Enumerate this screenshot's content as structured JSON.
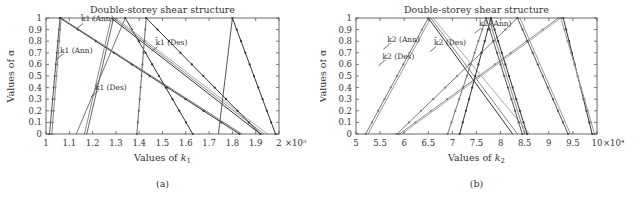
{
  "chart_data": [
    {
      "id": "a",
      "type": "line",
      "title": "Double-storey shear structure",
      "xlabel": "Values of k1",
      "xlabel_base": "Values of ",
      "xlabel_var": "k",
      "xlabel_sub": "1",
      "ylabel": "Values of α",
      "caption": "(a)",
      "x_multiplier": "×10⁵",
      "xlim": [
        1,
        2
      ],
      "ylim": [
        0,
        1
      ],
      "xticks": [
        "1",
        "1.1",
        "1.2",
        "1.3",
        "1.4",
        "1.5",
        "1.6",
        "1.7",
        "1.8",
        "1.9",
        "2"
      ],
      "yticks": [
        "0",
        "0.1",
        "0.2",
        "0.3",
        "0.4",
        "0.5",
        "0.6",
        "0.7",
        "0.8",
        "0.9",
        "1"
      ],
      "grid": false,
      "annotations": [
        {
          "text": "k̲1 (Ann)",
          "x": 1.06,
          "y": 0.7
        },
        {
          "text": "k̄1 (Ann)",
          "x": 1.15,
          "y": 0.97
        },
        {
          "text": "k̲1 (Des)",
          "x": 1.21,
          "y": 0.38
        },
        {
          "text": "k̄1 (Des)",
          "x": 1.47,
          "y": 0.77
        }
      ],
      "segments": [
        {
          "x": [
            1.015,
            1.06
          ],
          "y": [
            0,
            1
          ],
          "shade": "#555",
          "marker": true
        },
        {
          "x": [
            1.025,
            1.065
          ],
          "y": [
            0,
            1
          ],
          "shade": "#888",
          "marker": true
        },
        {
          "x": [
            1.06,
            1.83
          ],
          "y": [
            1,
            0
          ],
          "shade": "#333",
          "marker": true
        },
        {
          "x": [
            1.065,
            1.84
          ],
          "y": [
            1,
            0
          ],
          "shade": "#777",
          "marker": false
        },
        {
          "x": [
            1.13,
            1.34
          ],
          "y": [
            0,
            1
          ],
          "shade": "#777",
          "marker": false
        },
        {
          "x": [
            1.165,
            1.28
          ],
          "y": [
            0,
            1
          ],
          "shade": "#888",
          "marker": false
        },
        {
          "x": [
            1.175,
            1.29
          ],
          "y": [
            0,
            1
          ],
          "shade": "#666",
          "marker": false
        },
        {
          "x": [
            1.34,
            1.63
          ],
          "y": [
            1,
            0
          ],
          "shade": "#333",
          "marker": true
        },
        {
          "x": [
            1.28,
            1.92
          ],
          "y": [
            1,
            0
          ],
          "shade": "#333",
          "marker": false
        },
        {
          "x": [
            1.29,
            1.935
          ],
          "y": [
            1,
            0
          ],
          "shade": "#888",
          "marker": false
        },
        {
          "x": [
            1.3,
            1.95
          ],
          "y": [
            1,
            0
          ],
          "shade": "#aaa",
          "marker": false
        },
        {
          "x": [
            1.39,
            1.43
          ],
          "y": [
            0,
            1
          ],
          "shade": "#666",
          "marker": true
        },
        {
          "x": [
            1.43,
            1.92
          ],
          "y": [
            1,
            0
          ],
          "shade": "#333",
          "marker": true
        },
        {
          "x": [
            1.74,
            1.8
          ],
          "y": [
            0,
            1
          ],
          "shade": "#555",
          "marker": false
        },
        {
          "x": [
            1.8,
            1.985
          ],
          "y": [
            1,
            0
          ],
          "shade": "#333",
          "marker": true
        }
      ]
    },
    {
      "id": "b",
      "type": "line",
      "title": "Double-storey shear structure",
      "xlabel": "Values of k2",
      "xlabel_base": "Values of ",
      "xlabel_var": "k",
      "xlabel_sub": "2",
      "ylabel": "Values of α",
      "caption": "(b)",
      "x_multiplier": "×10⁴",
      "xlim": [
        5,
        10
      ],
      "ylim": [
        0,
        1
      ],
      "xticks": [
        "5",
        "5.5",
        "6",
        "6.5",
        "7",
        "7.5",
        "8",
        "8.5",
        "9",
        "9.5",
        "10"
      ],
      "yticks": [
        "0",
        "0.1",
        "0.2",
        "0.3",
        "0.4",
        "0.5",
        "0.6",
        "0.7",
        "0.8",
        "0.9",
        "1"
      ],
      "grid": false,
      "annotations": [
        {
          "text": "k̲2 (Ann)",
          "x": 5.65,
          "y": 0.79
        },
        {
          "text": "k̲2 (Des)",
          "x": 5.55,
          "y": 0.65
        },
        {
          "text": "k̄2 (Des)",
          "x": 6.62,
          "y": 0.77
        },
        {
          "text": "k̄2 (Ann)",
          "x": 7.55,
          "y": 0.93
        }
      ],
      "segments": [
        {
          "x": [
            5.2,
            6.5
          ],
          "y": [
            0,
            1
          ],
          "shade": "#777",
          "marker": true
        },
        {
          "x": [
            5.25,
            6.55
          ],
          "y": [
            0,
            1
          ],
          "shade": "#999",
          "marker": false
        },
        {
          "x": [
            6.5,
            8.25
          ],
          "y": [
            1,
            0
          ],
          "shade": "#333",
          "marker": false
        },
        {
          "x": [
            6.55,
            8.35
          ],
          "y": [
            1,
            0
          ],
          "shade": "#888",
          "marker": false
        },
        {
          "x": [
            6.6,
            8.6
          ],
          "y": [
            1,
            0
          ],
          "shade": "#aaa",
          "marker": false
        },
        {
          "x": [
            5.85,
            8.35
          ],
          "y": [
            0,
            1
          ],
          "shade": "#777",
          "marker": true
        },
        {
          "x": [
            5.9,
            9.2
          ],
          "y": [
            0,
            1
          ],
          "shade": "#888",
          "marker": true
        },
        {
          "x": [
            5.95,
            9.25
          ],
          "y": [
            0,
            1
          ],
          "shade": "#aaa",
          "marker": false
        },
        {
          "x": [
            6.9,
            7.7
          ],
          "y": [
            0,
            1
          ],
          "shade": "#777",
          "marker": true
        },
        {
          "x": [
            7.15,
            7.8
          ],
          "y": [
            0,
            1
          ],
          "shade": "#333",
          "marker": true
        },
        {
          "x": [
            7.7,
            8.45
          ],
          "y": [
            1,
            0
          ],
          "shade": "#555",
          "marker": true
        },
        {
          "x": [
            7.8,
            8.55
          ],
          "y": [
            1,
            0
          ],
          "shade": "#333",
          "marker": true
        },
        {
          "x": [
            7.75,
            8.5
          ],
          "y": [
            1,
            0
          ],
          "shade": "#888",
          "marker": false
        },
        {
          "x": [
            8.35,
            9.4
          ],
          "y": [
            1,
            0
          ],
          "shade": "#555",
          "marker": true
        },
        {
          "x": [
            8.4,
            9.45
          ],
          "y": [
            1,
            0
          ],
          "shade": "#999",
          "marker": false
        },
        {
          "x": [
            9.3,
            9.9
          ],
          "y": [
            1,
            0
          ],
          "shade": "#333",
          "marker": true
        },
        {
          "x": [
            9.25,
            9.95
          ],
          "y": [
            1,
            0
          ],
          "shade": "#999",
          "marker": true
        }
      ]
    }
  ]
}
